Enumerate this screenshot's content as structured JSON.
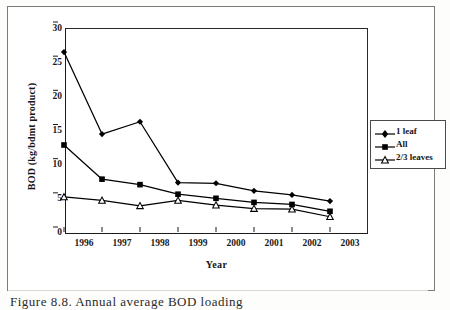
{
  "figure": {
    "caption": "Figure 8.8. Annual average BOD loading",
    "y_axis_title": "BOD (kg/bdmt product)",
    "x_axis_title": "Year"
  },
  "legend": {
    "entries": [
      {
        "label": "1 leaf",
        "marker": "filled-diamond-icon",
        "color": "#000000"
      },
      {
        "label": "All",
        "marker": "filled-square-icon",
        "color": "#000000"
      },
      {
        "label": "2/3 leaves",
        "marker": "open-triangle-icon",
        "color": "#000000"
      }
    ]
  },
  "axis": {
    "y_ticks": [
      "30",
      "25",
      "20",
      "15",
      "10",
      "5",
      "0"
    ],
    "x_ticks": [
      "1996",
      "1997",
      "1998",
      "1999",
      "2000",
      "2001",
      "2002",
      "2003"
    ]
  },
  "chart_data": {
    "type": "line",
    "title": "",
    "xlabel": "Year",
    "ylabel": "BOD (kg/bdmt product)",
    "categories": [
      "1996",
      "1997",
      "1998",
      "1999",
      "2000",
      "2001",
      "2002",
      "2003"
    ],
    "x": [
      1996,
      1997,
      1998,
      1999,
      2000,
      2001,
      2002,
      2003
    ],
    "ylim": [
      0,
      30
    ],
    "yticks": [
      0,
      5,
      10,
      15,
      20,
      25,
      30
    ],
    "grid": false,
    "legend_position": "right",
    "series": [
      {
        "name": "1 leaf",
        "marker": "filled-diamond",
        "color": "#000000",
        "values": [
          25.6,
          13.6,
          15.4,
          6.5,
          6.4,
          5.3,
          4.7,
          3.8
        ]
      },
      {
        "name": "All",
        "marker": "filled-square",
        "color": "#000000",
        "values": [
          12.0,
          7.0,
          6.2,
          4.8,
          4.2,
          3.6,
          3.3,
          2.3
        ]
      },
      {
        "name": "2/3 leaves",
        "marker": "open-triangle",
        "color": "#000000",
        "values": [
          4.4,
          3.9,
          3.1,
          3.9,
          3.2,
          2.7,
          2.6,
          1.5
        ]
      }
    ]
  }
}
